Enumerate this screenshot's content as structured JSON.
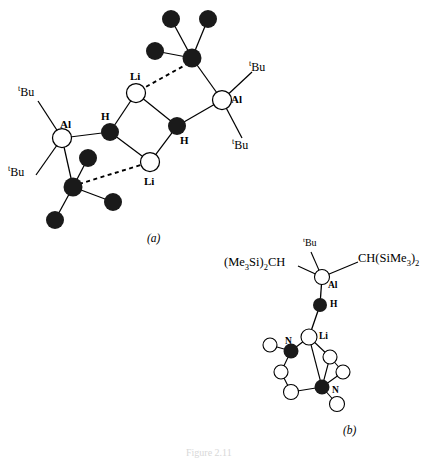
{
  "figure": {
    "caption_a": "(a)",
    "caption_b": "(b)",
    "bottom_caption": "Figure 2.11",
    "colors": {
      "stroke": "#000000",
      "filled_atom": "#1a1a1a",
      "open_atom": "#ffffff",
      "background": "#ffffff"
    }
  },
  "structure_a": {
    "name": "structure-a",
    "labels": {
      "al_left": "Al",
      "al_right": "Al",
      "li_top": "Li",
      "li_bottom": "Li",
      "h_left": "H",
      "h_right": "H",
      "tbu_upper_left_sup": "t",
      "tbu_upper_left": "Bu",
      "tbu_lower_left_sup": "t",
      "tbu_lower_left": "Bu",
      "tbu_upper_right_sup": "t",
      "tbu_upper_right": "Bu",
      "tbu_lower_right_sup": "t",
      "tbu_lower_right": "Bu"
    },
    "atoms": [
      {
        "id": "al-left",
        "kind": "open",
        "label": "Al",
        "x": 62,
        "y": 138,
        "r": 9.5
      },
      {
        "id": "al-right",
        "kind": "open",
        "label": "Al",
        "x": 222,
        "y": 100,
        "r": 9.5
      },
      {
        "id": "li-top",
        "kind": "open",
        "label": "Li",
        "x": 136,
        "y": 93,
        "r": 9.5
      },
      {
        "id": "li-bottom",
        "kind": "open",
        "label": "Li",
        "x": 150,
        "y": 162,
        "r": 9.5
      },
      {
        "id": "h-left",
        "kind": "filled",
        "label": "H",
        "x": 110,
        "y": 132,
        "r": 9
      },
      {
        "id": "h-right",
        "kind": "filled",
        "label": "H",
        "x": 177,
        "y": 126,
        "r": 9
      },
      {
        "id": "c-top",
        "kind": "filled",
        "label": "C",
        "x": 192,
        "y": 58,
        "r": 9.5
      },
      {
        "id": "c-top-si1",
        "kind": "filled",
        "label": "Si",
        "x": 171,
        "y": 19,
        "r": 9
      },
      {
        "id": "c-top-si2",
        "kind": "filled",
        "label": "Si",
        "x": 208,
        "y": 19,
        "r": 9
      },
      {
        "id": "c-top-si3",
        "kind": "filled",
        "label": "Si",
        "x": 155,
        "y": 51,
        "r": 9
      },
      {
        "id": "c-bot",
        "kind": "filled",
        "label": "C",
        "x": 73,
        "y": 187,
        "r": 9.5
      },
      {
        "id": "c-bot-si1",
        "kind": "filled",
        "label": "Si",
        "x": 88,
        "y": 158,
        "r": 9
      },
      {
        "id": "c-bot-si2",
        "kind": "filled",
        "label": "Si",
        "x": 113,
        "y": 202,
        "r": 9
      },
      {
        "id": "c-bot-si3",
        "kind": "filled",
        "label": "Si",
        "x": 55,
        "y": 220,
        "r": 9
      }
    ],
    "bonds": [
      {
        "from": "al-left",
        "to": "h-left",
        "style": "solid"
      },
      {
        "from": "al-left",
        "to": "c-bot",
        "style": "solid"
      },
      {
        "from": "al-right",
        "to": "h-right",
        "style": "solid"
      },
      {
        "from": "al-right",
        "to": "c-top",
        "style": "solid"
      },
      {
        "from": "h-left",
        "to": "li-top",
        "style": "solid"
      },
      {
        "from": "h-left",
        "to": "li-bottom",
        "style": "solid"
      },
      {
        "from": "h-right",
        "to": "li-top",
        "style": "solid"
      },
      {
        "from": "h-right",
        "to": "li-bottom",
        "style": "solid"
      },
      {
        "from": "c-top",
        "to": "li-top",
        "style": "dashed"
      },
      {
        "from": "c-bot",
        "to": "li-bottom",
        "style": "dashed"
      },
      {
        "from": "c-top",
        "to": "c-top-si1",
        "style": "solid"
      },
      {
        "from": "c-top",
        "to": "c-top-si2",
        "style": "solid"
      },
      {
        "from": "c-top",
        "to": "c-top-si3",
        "style": "solid"
      },
      {
        "from": "c-bot",
        "to": "c-bot-si1",
        "style": "solid"
      },
      {
        "from": "c-bot",
        "to": "c-bot-si2",
        "style": "solid"
      },
      {
        "from": "c-bot",
        "to": "c-bot-si3",
        "style": "solid"
      }
    ]
  },
  "structure_b": {
    "name": "structure-b",
    "labels": {
      "al": "Al",
      "h": "H",
      "li": "Li",
      "n_upper": "N",
      "n_lower": "N",
      "tbu_sup": "t",
      "tbu": "Bu",
      "left_group": "(Me₃Si)₂CH",
      "right_group": "CH(SiMe₃)₂"
    },
    "left_group_parts": {
      "pre": "(Me",
      "sub1": "3",
      "mid": "Si)",
      "sub2": "2",
      "post": "CH"
    },
    "right_group_parts": {
      "pre": "CH(SiMe",
      "sub1": "3",
      "mid": ")",
      "sub2": "2"
    },
    "atoms": [
      {
        "id": "b-al",
        "kind": "open",
        "label": "Al",
        "x": 322,
        "y": 277,
        "r": 7.5
      },
      {
        "id": "b-h",
        "kind": "filled",
        "label": "H",
        "x": 320,
        "y": 305,
        "r": 7
      },
      {
        "id": "b-li",
        "kind": "open",
        "label": "Li",
        "x": 309,
        "y": 337,
        "r": 8
      },
      {
        "id": "b-n1",
        "kind": "filled",
        "label": "N",
        "x": 291,
        "y": 351,
        "r": 7.5
      },
      {
        "id": "b-n2",
        "kind": "filled",
        "label": "N",
        "x": 322,
        "y": 387,
        "r": 7.5
      },
      {
        "id": "b-c1",
        "kind": "open",
        "label": "C",
        "x": 270,
        "y": 345,
        "r": 7
      },
      {
        "id": "b-c2",
        "kind": "open",
        "label": "C",
        "x": 281,
        "y": 372,
        "r": 7
      },
      {
        "id": "b-c3",
        "kind": "open",
        "label": "C",
        "x": 291,
        "y": 392,
        "r": 7.5
      },
      {
        "id": "b-c4",
        "kind": "open",
        "label": "C",
        "x": 330,
        "y": 357,
        "r": 7
      },
      {
        "id": "b-c5",
        "kind": "open",
        "label": "C",
        "x": 343,
        "y": 372,
        "r": 7
      },
      {
        "id": "b-c6",
        "kind": "open",
        "label": "C",
        "x": 337,
        "y": 404,
        "r": 7.5
      }
    ],
    "bonds": [
      {
        "from": "b-al",
        "to": "b-h",
        "style": "solid"
      },
      {
        "from": "b-h",
        "to": "b-li",
        "style": "solid"
      },
      {
        "from": "b-li",
        "to": "b-n1",
        "style": "solid"
      },
      {
        "from": "b-li",
        "to": "b-n2",
        "style": "solid"
      },
      {
        "from": "b-li",
        "to": "b-c4",
        "style": "solid"
      },
      {
        "from": "b-n1",
        "to": "b-c1",
        "style": "solid"
      },
      {
        "from": "b-n1",
        "to": "b-c2",
        "style": "solid"
      },
      {
        "from": "b-c2",
        "to": "b-c3",
        "style": "solid"
      },
      {
        "from": "b-c3",
        "to": "b-n2",
        "style": "solid"
      },
      {
        "from": "b-n2",
        "to": "b-c5",
        "style": "solid"
      },
      {
        "from": "b-n2",
        "to": "b-c6",
        "style": "solid"
      },
      {
        "from": "b-c4",
        "to": "b-c5",
        "style": "solid"
      },
      {
        "from": "b-c4",
        "to": "b-n2",
        "style": "solid"
      }
    ]
  }
}
